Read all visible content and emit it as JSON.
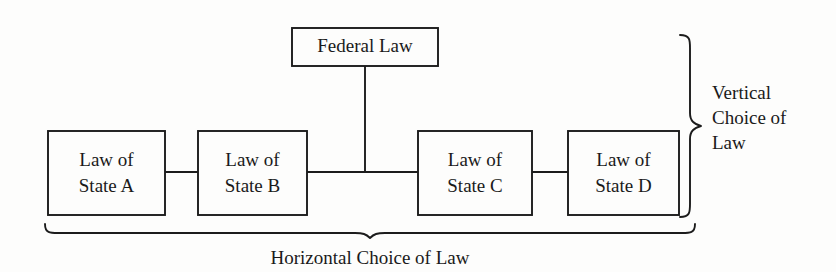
{
  "diagram": {
    "title_text_present": false,
    "background_color": "#fdfdfc",
    "line_color": "#1c1c1c",
    "text_color": "#1a1a1a",
    "nodes": [
      {
        "id": "federal-law",
        "line1": "Federal Law",
        "line2": "",
        "x": 292,
        "y": 28,
        "w": 146,
        "h": 38
      },
      {
        "id": "state-a",
        "line1": "Law of",
        "line2": "State A",
        "x": 48,
        "y": 131,
        "w": 117,
        "h": 84
      },
      {
        "id": "state-b",
        "line1": "Law of",
        "line2": "State B",
        "x": 198,
        "y": 131,
        "w": 109,
        "h": 84
      },
      {
        "id": "state-c",
        "line1": "Law of",
        "line2": "State C",
        "x": 418,
        "y": 131,
        "w": 114,
        "h": 84
      },
      {
        "id": "state-d",
        "line1": "Law of",
        "line2": "State D",
        "x": 568,
        "y": 131,
        "w": 111,
        "h": 84
      }
    ],
    "connectors": [
      {
        "id": "federal-stem",
        "x1": 365,
        "y1": 66,
        "x2": 365,
        "y2": 172
      },
      {
        "id": "a-to-b",
        "x1": 165,
        "y1": 172,
        "x2": 198,
        "y2": 172
      },
      {
        "id": "b-to-c",
        "x1": 307,
        "y1": 172,
        "x2": 418,
        "y2": 172
      },
      {
        "id": "c-to-d",
        "x1": 532,
        "y1": 172,
        "x2": 568,
        "y2": 172
      }
    ],
    "braces": {
      "vertical": {
        "label_lines": [
          "Vertical",
          "Choice of",
          "Law"
        ],
        "label_x": 712,
        "label_line_y": [
          99,
          124,
          149
        ],
        "spine_x": 690,
        "top_y": 35,
        "bottom_y": 217,
        "tip_x": 701,
        "mid_y": 126
      },
      "horizontal": {
        "label": "Horizontal Choice of Law",
        "label_x": 370,
        "label_y": 264,
        "spine_y": 226,
        "left_x": 45,
        "right_x": 695,
        "tip_y": 238,
        "mid_x": 370
      }
    }
  }
}
